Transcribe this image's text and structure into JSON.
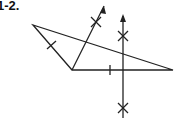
{
  "problem": {
    "label": "1-2."
  },
  "diagram": {
    "stroke_color": "#222222",
    "triangle": {
      "vertices": {
        "left": [
          33,
          25
        ],
        "bottom": [
          72,
          70
        ],
        "right": [
          173,
          70
        ]
      }
    },
    "tick_marks": [
      "left-side-midpoint",
      "base-segment-mark"
    ],
    "constructions": [
      {
        "type": "ray-with-arc-mark",
        "from": [
          72,
          70
        ],
        "to": [
          104,
          6
        ]
      },
      {
        "type": "perpendicular-bisector",
        "x": 123,
        "from_y": 16,
        "to_y": 118
      }
    ]
  }
}
